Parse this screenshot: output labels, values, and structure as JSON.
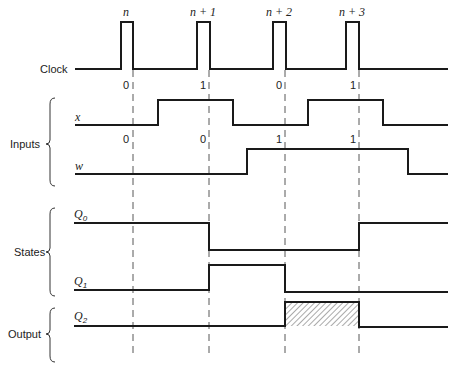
{
  "clock": {
    "label": "Clock",
    "pulse_labels": [
      "n",
      "n + 1",
      "n + 2",
      "n + 3"
    ],
    "edge_values_x": [
      "0",
      "1",
      "0",
      "1"
    ]
  },
  "groups": {
    "inputs": "Inputs",
    "states": "States",
    "output": "Output"
  },
  "signals": {
    "x": {
      "name": "x"
    },
    "w": {
      "name": "w",
      "edge_values": [
        "0",
        "0",
        "1",
        "1"
      ]
    },
    "q0": {
      "name": "Q",
      "sub": "0"
    },
    "q1": {
      "name": "Q",
      "sub": "1"
    },
    "q2": {
      "name": "Q",
      "sub": "2",
      "hatched_high": true
    }
  },
  "colors": {
    "line": "#1a1a1a",
    "background": "#ffffff"
  }
}
